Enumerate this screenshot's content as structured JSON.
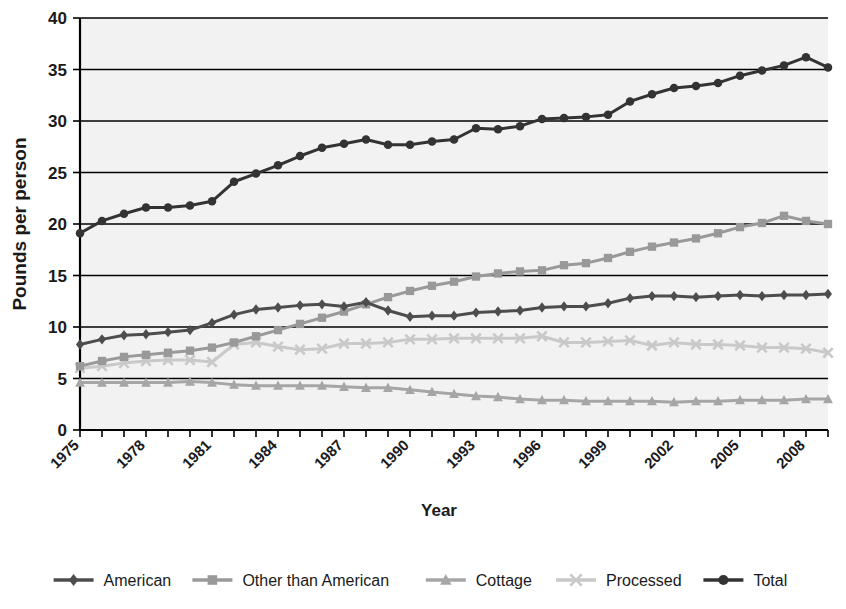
{
  "chart_data": {
    "type": "line",
    "title": "",
    "xlabel": "Year",
    "ylabel": "Pounds per person",
    "ylim": [
      0,
      40
    ],
    "xlim": [
      1975,
      2009
    ],
    "ytick_values": [
      0,
      5,
      10,
      15,
      20,
      25,
      30,
      35,
      40
    ],
    "ytick_labels": [
      "0",
      "5",
      "10",
      "15",
      "20",
      "25",
      "30",
      "35",
      "40"
    ],
    "grid": "horizontal",
    "legend_position": "bottom",
    "x": [
      1975,
      1976,
      1977,
      1978,
      1979,
      1980,
      1981,
      1982,
      1983,
      1984,
      1985,
      1986,
      1987,
      1988,
      1989,
      1990,
      1991,
      1992,
      1993,
      1994,
      1995,
      1996,
      1997,
      1998,
      1999,
      2000,
      2001,
      2002,
      2003,
      2004,
      2005,
      2006,
      2007,
      2008,
      2009
    ],
    "xtick_labels": [
      "1975",
      "1978",
      "1981",
      "1984",
      "1987",
      "1990",
      "1993",
      "1996",
      "1999",
      "2002",
      "2005",
      "2008"
    ],
    "xtick_label_years": [
      1975,
      1978,
      1981,
      1984,
      1987,
      1990,
      1993,
      1996,
      1999,
      2002,
      2005,
      2008
    ],
    "series": [
      {
        "name": "American",
        "marker": "diamond",
        "color": "#4d4d4d",
        "values": [
          8.3,
          8.8,
          9.2,
          9.3,
          9.5,
          9.7,
          10.4,
          11.2,
          11.7,
          11.9,
          12.1,
          12.2,
          12.0,
          12.4,
          11.6,
          11.0,
          11.1,
          11.1,
          11.4,
          11.5,
          11.6,
          11.9,
          12.0,
          12.0,
          12.3,
          12.8,
          13.0,
          13.0,
          12.9,
          13.0,
          13.1,
          13.0,
          13.1,
          13.1,
          13.2
        ]
      },
      {
        "name": "Other than American",
        "marker": "square",
        "color": "#999999",
        "values": [
          6.2,
          6.7,
          7.1,
          7.3,
          7.5,
          7.7,
          8.0,
          8.5,
          9.1,
          9.7,
          10.3,
          10.9,
          11.5,
          12.2,
          12.9,
          13.5,
          14.0,
          14.4,
          14.9,
          15.2,
          15.4,
          15.5,
          16.0,
          16.2,
          16.7,
          17.3,
          17.8,
          18.2,
          18.6,
          19.1,
          19.7,
          20.1,
          20.8,
          20.3,
          20.0
        ]
      },
      {
        "name": "Cottage",
        "marker": "triangle",
        "color": "#a6a6a6",
        "values": [
          4.6,
          4.6,
          4.6,
          4.6,
          4.6,
          4.7,
          4.6,
          4.4,
          4.3,
          4.3,
          4.3,
          4.3,
          4.2,
          4.1,
          4.1,
          3.9,
          3.7,
          3.5,
          3.3,
          3.2,
          3.0,
          2.9,
          2.9,
          2.8,
          2.8,
          2.8,
          2.8,
          2.7,
          2.8,
          2.8,
          2.9,
          2.9,
          2.9,
          3.0,
          3.0
        ]
      },
      {
        "name": "Processed",
        "marker": "x",
        "color": "#c9c9c9",
        "values": [
          6.0,
          6.2,
          6.5,
          6.7,
          6.8,
          6.8,
          6.6,
          8.3,
          8.5,
          8.1,
          7.8,
          7.9,
          8.4,
          8.4,
          8.5,
          8.8,
          8.8,
          8.9,
          8.9,
          8.9,
          8.9,
          9.1,
          8.5,
          8.5,
          8.6,
          8.7,
          8.2,
          8.5,
          8.3,
          8.3,
          8.2,
          8.0,
          8.0,
          7.9,
          7.5
        ]
      },
      {
        "name": "Total",
        "marker": "circle",
        "color": "#333333",
        "values": [
          19.1,
          20.3,
          21.0,
          21.6,
          21.6,
          21.8,
          22.2,
          24.1,
          24.9,
          25.7,
          26.6,
          27.4,
          27.8,
          28.2,
          27.7,
          27.7,
          28.0,
          28.2,
          29.3,
          29.2,
          29.5,
          30.2,
          30.3,
          30.4,
          30.6,
          31.9,
          32.6,
          33.2,
          33.4,
          33.7,
          34.4,
          34.9,
          35.4,
          36.2,
          35.2
        ]
      }
    ]
  },
  "legend": {
    "items": [
      {
        "label": "American",
        "marker": "diamond",
        "color": "#4d4d4d"
      },
      {
        "label": "Other than American",
        "marker": "square",
        "color": "#999999"
      },
      {
        "label": "Cottage",
        "marker": "triangle",
        "color": "#a6a6a6"
      },
      {
        "label": "Processed",
        "marker": "x",
        "color": "#c9c9c9"
      },
      {
        "label": "Total",
        "marker": "circle",
        "color": "#333333"
      }
    ]
  },
  "colors": {
    "plot_background": "#f2f2f2",
    "page_background": "#ffffff",
    "axis": "#000000",
    "text": "#1a1a1a"
  }
}
